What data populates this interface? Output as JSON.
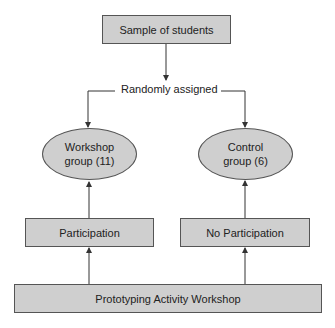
{
  "diagram": {
    "type": "flowchart",
    "nodes": {
      "sample": {
        "label": "Sample of students",
        "shape": "rectangle"
      },
      "assign": {
        "label": "Randomly assigned",
        "shape": "text"
      },
      "workshop_group": {
        "line1": "Workshop",
        "line2": "group (11)",
        "shape": "ellipse"
      },
      "control_group": {
        "line1": "Control",
        "line2": "group (6)",
        "shape": "ellipse"
      },
      "participation": {
        "label": "Participation",
        "shape": "rectangle"
      },
      "no_participation": {
        "label": "No Participation",
        "shape": "rectangle"
      },
      "activity": {
        "label": "Prototyping Activity Workshop",
        "shape": "rectangle"
      }
    },
    "edges": [
      {
        "from": "Sample of students",
        "to": "Randomly assigned"
      },
      {
        "from": "Randomly assigned",
        "to": "Workshop group (11)"
      },
      {
        "from": "Randomly assigned",
        "to": "Control group (6)"
      },
      {
        "from": "Participation",
        "to": "Workshop group (11)"
      },
      {
        "from": "No Participation",
        "to": "Control group (6)"
      },
      {
        "from": "Prototyping Activity Workshop",
        "to": "Participation"
      },
      {
        "from": "Prototyping Activity Workshop",
        "to": "No Participation"
      }
    ],
    "colors": {
      "fill": "#cfcfcf",
      "stroke": "#555555",
      "line": "#333333"
    }
  }
}
